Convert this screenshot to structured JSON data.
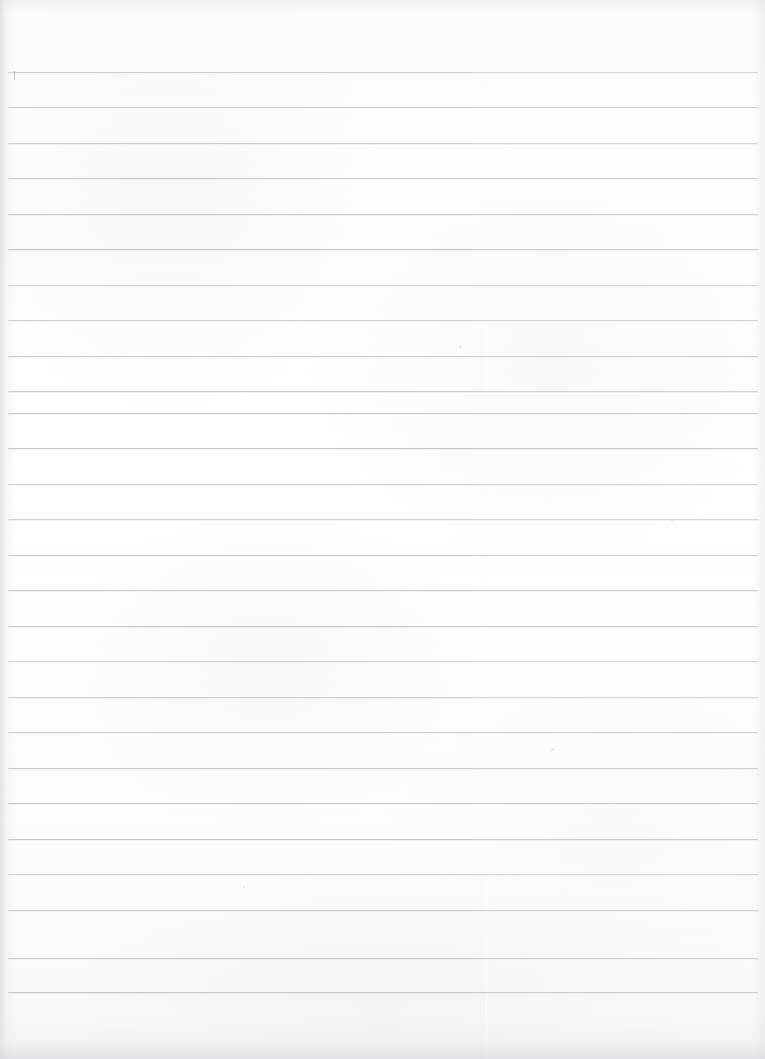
{
  "document": {
    "kind": "scanned-lined-notebook-page",
    "title": "Blank ruled notebook page (scan)",
    "content_text": "",
    "handwriting_text": "",
    "printed_text": "",
    "page_width_px": 765,
    "page_height_px": 1059
  },
  "colors": {
    "paper": "#fdfdfd",
    "rule_line": "#b9bec5",
    "rule_line_left": "#aeb4bb",
    "edge_shadow": "#cbcfd4",
    "tick_mark": "#a9afb7",
    "speck": "#d8dbdf"
  },
  "ruling": {
    "style": "wide-ruled horizontal lines",
    "line_count": 27,
    "line_spacing_px": 35.5,
    "first_line_y_px": 72,
    "last_line_y_px": 995,
    "line_start_x_px": 8,
    "line_end_x_px": 758,
    "line_thickness_px": 1,
    "top_margin_px": 72,
    "bottom_margin_px": 64,
    "has_vertical_margin_rule": false,
    "line_y_positions": [
      72,
      107,
      143,
      178,
      214,
      249,
      285,
      320,
      356,
      391,
      413,
      448,
      484,
      519,
      555,
      590,
      626,
      661,
      697,
      732,
      768,
      803,
      839,
      874,
      910,
      958,
      992
    ]
  },
  "scan_artifacts": {
    "vertical_seam_x_px": 485,
    "left_edge_shadow_width_px": 16,
    "right_edge_shadow_width_px": 12,
    "top_edge_shadow_height_px": 14,
    "bottom_edge_shadow_height_px": 44,
    "tick_mark": {
      "label": "short vertical pen tick at left end of first rule",
      "x_px": 14,
      "y_px": 71,
      "height_px": 9
    },
    "specks": [
      {
        "x_px": 459,
        "y_px": 345,
        "size_px": 3
      },
      {
        "x_px": 551,
        "y_px": 748,
        "size_px": 3
      },
      {
        "x_px": 243,
        "y_px": 886,
        "size_px": 2
      },
      {
        "x_px": 671,
        "y_px": 520,
        "size_px": 2
      }
    ]
  }
}
